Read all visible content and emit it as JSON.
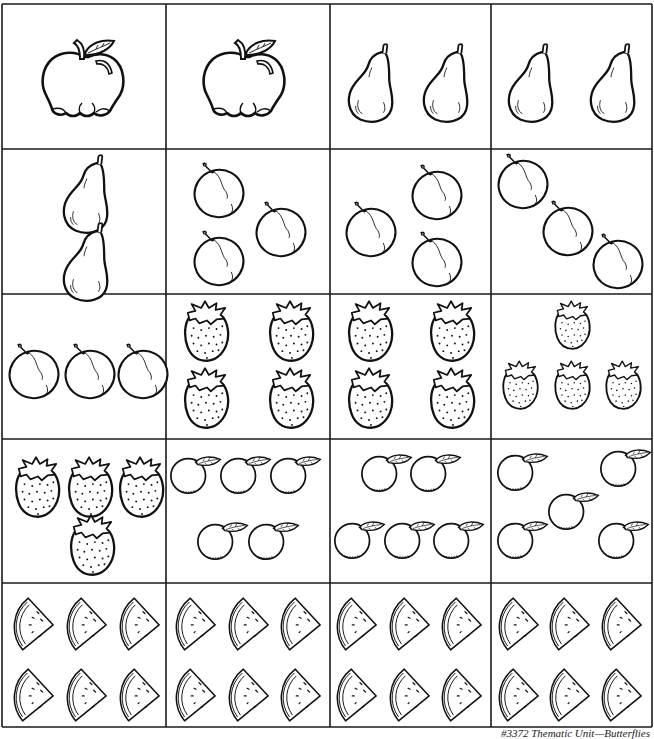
{
  "worksheet": {
    "rows": [
      {
        "cells": [
          {
            "fruit": "apple",
            "count": 1
          },
          {
            "fruit": "apple",
            "count": 1
          },
          {
            "fruit": "pear",
            "count": 2
          },
          {
            "fruit": "pear",
            "count": 2
          }
        ]
      },
      {
        "cells": [
          {
            "fruit": "pear",
            "count": 2
          },
          {
            "fruit": "plum",
            "count": 3
          },
          {
            "fruit": "plum",
            "count": 3
          },
          {
            "fruit": "plum",
            "count": 3
          }
        ]
      },
      {
        "cells": [
          {
            "fruit": "plum",
            "count": 3
          },
          {
            "fruit": "strawberry",
            "count": 4
          },
          {
            "fruit": "strawberry",
            "count": 4
          },
          {
            "fruit": "strawberry",
            "count": 4
          }
        ]
      },
      {
        "cells": [
          {
            "fruit": "strawberry",
            "count": 4
          },
          {
            "fruit": "orange",
            "count": 5
          },
          {
            "fruit": "orange",
            "count": 5
          },
          {
            "fruit": "orange",
            "count": 5
          }
        ]
      },
      {
        "cells": [
          {
            "fruit": "watermelon",
            "count": 6
          },
          {
            "fruit": "watermelon",
            "count": 6
          },
          {
            "fruit": "watermelon",
            "count": 6
          },
          {
            "fruit": "watermelon",
            "count": 6
          }
        ]
      }
    ],
    "icons": {
      "apple": "apple-icon",
      "pear": "pear-icon",
      "plum": "plum-icon",
      "strawberry": "strawberry-icon",
      "orange": "orange-icon",
      "watermelon": "watermelon-slice-icon"
    },
    "line_color": "#1a1a1a",
    "footer": "#3372 Thematic Unit—Butterflies"
  }
}
